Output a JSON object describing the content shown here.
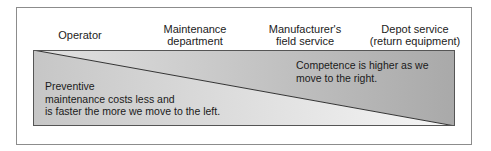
{
  "header": {
    "columns": [
      {
        "label": "Operator"
      },
      {
        "label_line1": "Maintenance",
        "label_line2": "department"
      },
      {
        "label_line1": "Manufacturer's",
        "label_line2": "field service"
      },
      {
        "label_line1": "Depot service",
        "label_line2": "(return equipment)"
      }
    ]
  },
  "diagram": {
    "upper_right_note": {
      "line1": "Competence is higher as we",
      "line2": "move to the right."
    },
    "lower_left_note": {
      "line1": "Preventive",
      "line2": "maintenance costs less and",
      "line3": "is faster the more we move to the left."
    },
    "colors": {
      "upper_left": "#e2e2e2",
      "upper_right": "#a9a9a9",
      "lower_left": "#c6c6c6",
      "lower_right": "#f6f6f6",
      "border": "#555555",
      "frame": "#8c8c8c"
    }
  }
}
